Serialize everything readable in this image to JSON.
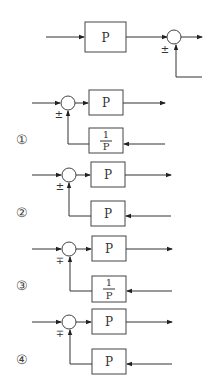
{
  "original": {
    "block_label": "P",
    "summer_sign": "±"
  },
  "options": [
    {
      "number": "①",
      "forward_label": "P",
      "feedback_numerator": "1",
      "feedback_denominator": "P",
      "feedback_label": "",
      "sign": "±"
    },
    {
      "number": "②",
      "forward_label": "P",
      "feedback_numerator": "",
      "feedback_denominator": "",
      "feedback_label": "P",
      "sign": "±"
    },
    {
      "number": "③",
      "forward_label": "P",
      "feedback_numerator": "1",
      "feedback_denominator": "P",
      "feedback_label": "",
      "sign": "∓"
    },
    {
      "number": "④",
      "forward_label": "P",
      "feedback_numerator": "",
      "feedback_denominator": "",
      "feedback_label": "P",
      "sign": "∓"
    }
  ]
}
